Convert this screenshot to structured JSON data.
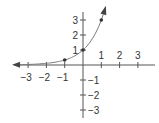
{
  "chart_data": {
    "type": "line",
    "title": "",
    "xlabel": "",
    "ylabel": "",
    "function": "y = 3^x",
    "xlim": [
      -3.8,
      4
    ],
    "ylim": [
      -3.2,
      4
    ],
    "x_ticks": [
      -3,
      -2,
      -1,
      1,
      2,
      3
    ],
    "y_ticks": [
      3,
      2,
      1,
      -1,
      -2,
      -3
    ],
    "x_tick_labels": [
      "−3",
      "−2",
      "−1",
      "1",
      "2",
      "3"
    ],
    "y_tick_labels": [
      "3",
      "2",
      "1",
      "−1",
      "−2",
      "−3"
    ],
    "points": [
      {
        "x": -1,
        "y": 0.3333
      },
      {
        "x": 0,
        "y": 1
      },
      {
        "x": 1,
        "y": 3
      }
    ],
    "grid": false,
    "colors": {
      "axis": "#555555",
      "curve": "#777777",
      "point": "#333333"
    }
  }
}
